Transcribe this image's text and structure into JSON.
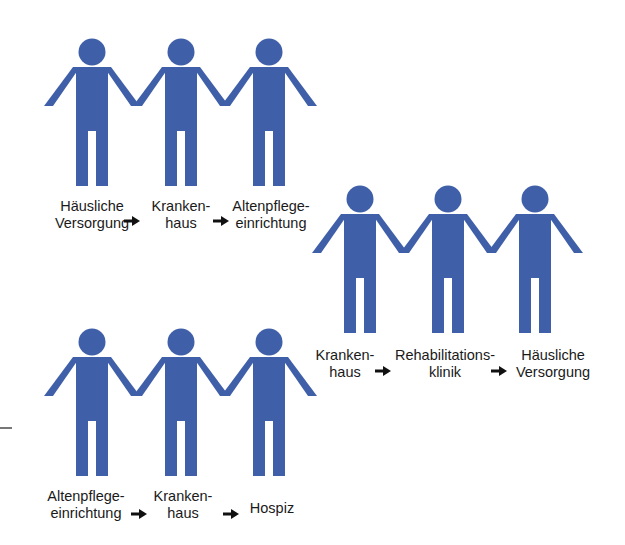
{
  "figure_color": "#3f5fa8",
  "groups": [
    {
      "name": "group-top",
      "steps": [
        {
          "line1": "Häusliche",
          "line2": "Versorgung"
        },
        {
          "line1": "Kranken-",
          "line2": "haus"
        },
        {
          "line1": "Altenpflege-",
          "line2": "einrichtung"
        }
      ]
    },
    {
      "name": "group-middle",
      "steps": [
        {
          "line1": "Kranken-",
          "line2": "haus"
        },
        {
          "line1": "Rehabilitations-",
          "line2": "klinik"
        },
        {
          "line1": "Häusliche",
          "line2": "Versorgung"
        }
      ]
    },
    {
      "name": "group-bottom",
      "steps": [
        {
          "line1": "Altenpflege-",
          "line2": "einrichtung"
        },
        {
          "line1": "Kranken-",
          "line2": "haus"
        },
        {
          "line1": "Hospiz",
          "line2": ""
        }
      ]
    }
  ],
  "icons": {
    "person": "person-icon",
    "arrow": "arrow-right-icon"
  }
}
